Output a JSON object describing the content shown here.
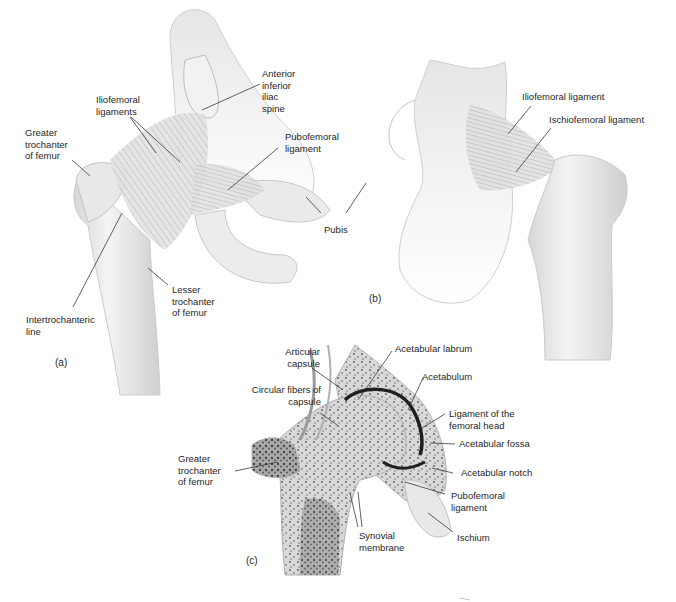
{
  "figure": {
    "panels": [
      {
        "id": "a",
        "tag": "(a)",
        "labels": {
          "anterior_inferior_iliac_spine": "Anterior\ninferior\niliac\nspine",
          "iliofemoral_ligaments": "Iliofemoral\nligaments",
          "greater_trochanter": "Greater\ntrochanter\nof femur",
          "pubofemoral_ligament": "Pubofemoral\nligament",
          "pubis": "Pubis",
          "lesser_trochanter": "Lesser\ntrochanter\nof femur",
          "intertrochanteric_line": "Intertrochanteric\nline"
        }
      },
      {
        "id": "b",
        "tag": "(b)",
        "labels": {
          "iliofemoral_ligament": "Iliofemoral ligament",
          "ischiofemoral_ligament": "Ischiofemoral ligament"
        }
      },
      {
        "id": "c",
        "tag": "(c)",
        "labels": {
          "articular_capsule": "Articular\ncapsule",
          "acetabular_labrum": "Acetabular labrum",
          "acetabulum": "Acetabulum",
          "circular_fibers": "Circular fibers of\ncapsule",
          "ligament_femoral_head": "Ligament of the\nfemoral head",
          "acetabular_fossa": "Acetabular fossa",
          "greater_trochanter": "Greater\ntrochanter\nof femur",
          "acetabular_notch": "Acetabular notch",
          "pubofemoral_ligament": "Pubofemoral\nligament",
          "synovial_membrane": "Synovial\nmembrane",
          "ischium": "Ischium"
        }
      }
    ]
  }
}
